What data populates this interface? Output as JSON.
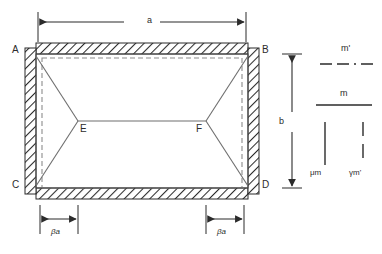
{
  "figure": {
    "colors": {
      "line": "#3a3a3a",
      "hatch": "#2b2b2b",
      "dashed_inner": "#8c8c8c",
      "yield_line": "#6e6e6e",
      "text": "#2b2b2b",
      "background": "#ffffff"
    }
  },
  "corners": [
    {
      "id": "A",
      "label": "A",
      "position": "top-left"
    },
    {
      "id": "B",
      "label": "B",
      "position": "top-right"
    },
    {
      "id": "C",
      "label": "C",
      "position": "bottom-left"
    },
    {
      "id": "D",
      "label": "D",
      "position": "bottom-right"
    }
  ],
  "nodes": [
    {
      "id": "E",
      "label": "E",
      "position": "interior-left"
    },
    {
      "id": "F",
      "label": "F",
      "position": "interior-right"
    }
  ],
  "dimensions": {
    "width": {
      "label": "a",
      "orientation": "horizontal",
      "location": "top"
    },
    "height": {
      "label": "b",
      "orientation": "vertical",
      "location": "right"
    },
    "offset_left": {
      "label": "βa",
      "orientation": "horizontal",
      "location": "bottom-left"
    },
    "offset_right": {
      "label": "βa",
      "orientation": "horizontal",
      "location": "bottom-right"
    }
  },
  "legend": {
    "items": [
      {
        "id": "m-prime",
        "label": "m'",
        "base": "m",
        "prime": true,
        "style": "dash-dot",
        "orientation": "horizontal"
      },
      {
        "id": "m",
        "label": "m",
        "base": "m",
        "prime": false,
        "style": "solid",
        "orientation": "horizontal"
      },
      {
        "id": "mu-m",
        "label": "μm",
        "prefix": "μ",
        "base": "m",
        "prime": false,
        "style": "solid",
        "orientation": "vertical"
      },
      {
        "id": "gamma-m-prime",
        "label": "γm'",
        "prefix": "γ",
        "base": "m",
        "prime": true,
        "style": "dashed",
        "orientation": "vertical"
      }
    ]
  }
}
